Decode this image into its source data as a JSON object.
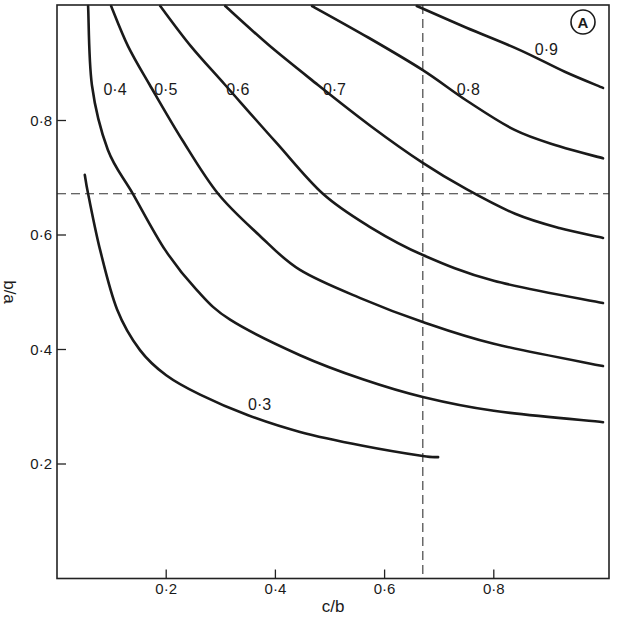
{
  "chart_data": {
    "type": "line",
    "title": "",
    "panel_label": "A",
    "xlabel": "c/b",
    "ylabel": "b/a",
    "xlim": [
      0,
      1.0
    ],
    "ylim": [
      0,
      1.0
    ],
    "grid": false,
    "legend": "none (curves labeled inline)",
    "x_ticks": [
      0.2,
      0.4,
      0.6,
      0.8
    ],
    "x_tick_labels": [
      "0·2",
      "0·4",
      "0·6",
      "0·8"
    ],
    "y_ticks": [
      0.2,
      0.4,
      0.6,
      0.8
    ],
    "y_tick_labels": [
      "0·2",
      "0·4",
      "0·6",
      "0·8"
    ],
    "reference_lines": {
      "vertical_x": 0.67,
      "horizontal_y": 0.672,
      "style": "dashed"
    },
    "series": [
      {
        "name": "0·3",
        "label_pos": [
          0.35,
          0.305
        ],
        "points": [
          [
            0.051,
            0.705
          ],
          [
            0.057,
            0.672
          ],
          [
            0.079,
            0.574
          ],
          [
            0.11,
            0.47
          ],
          [
            0.152,
            0.399
          ],
          [
            0.2,
            0.355
          ],
          [
            0.262,
            0.321
          ],
          [
            0.35,
            0.285
          ],
          [
            0.445,
            0.256
          ],
          [
            0.56,
            0.232
          ],
          [
            0.67,
            0.214
          ],
          [
            0.698,
            0.212
          ]
        ]
      },
      {
        "name": "0·4",
        "label_pos": [
          0.085,
          0.855
        ],
        "points": [
          [
            0.057,
            1.0
          ],
          [
            0.064,
            0.862
          ],
          [
            0.093,
            0.749
          ],
          [
            0.139,
            0.672
          ],
          [
            0.198,
            0.574
          ],
          [
            0.255,
            0.505
          ],
          [
            0.317,
            0.452
          ],
          [
            0.445,
            0.39
          ],
          [
            0.56,
            0.348
          ],
          [
            0.67,
            0.317
          ],
          [
            0.8,
            0.293
          ],
          [
            1.0,
            0.273
          ]
        ]
      },
      {
        "name": "0·5",
        "label_pos": [
          0.178,
          0.855
        ],
        "points": [
          [
            0.099,
            1.0
          ],
          [
            0.13,
            0.93
          ],
          [
            0.17,
            0.862
          ],
          [
            0.23,
            0.765
          ],
          [
            0.295,
            0.672
          ],
          [
            0.37,
            0.6
          ],
          [
            0.445,
            0.539
          ],
          [
            0.56,
            0.488
          ],
          [
            0.67,
            0.448
          ],
          [
            0.8,
            0.41
          ],
          [
            1.0,
            0.371
          ]
        ]
      },
      {
        "name": "0·6",
        "label_pos": [
          0.31,
          0.855
        ],
        "points": [
          [
            0.189,
            1.0
          ],
          [
            0.245,
            0.93
          ],
          [
            0.308,
            0.862
          ],
          [
            0.4,
            0.763
          ],
          [
            0.487,
            0.672
          ],
          [
            0.575,
            0.613
          ],
          [
            0.67,
            0.565
          ],
          [
            0.8,
            0.52
          ],
          [
            1.0,
            0.481
          ]
        ]
      },
      {
        "name": "0·7",
        "label_pos": [
          0.487,
          0.855
        ],
        "points": [
          [
            0.308,
            1.0
          ],
          [
            0.39,
            0.93
          ],
          [
            0.478,
            0.862
          ],
          [
            0.575,
            0.79
          ],
          [
            0.67,
            0.726
          ],
          [
            0.75,
            0.68
          ],
          [
            0.839,
            0.637
          ],
          [
            0.92,
            0.612
          ],
          [
            1.0,
            0.595
          ]
        ]
      },
      {
        "name": "0·8",
        "label_pos": [
          0.732,
          0.855
        ],
        "points": [
          [
            0.467,
            1.0
          ],
          [
            0.57,
            0.945
          ],
          [
            0.67,
            0.888
          ],
          [
            0.75,
            0.835
          ],
          [
            0.839,
            0.783
          ],
          [
            0.92,
            0.755
          ],
          [
            1.0,
            0.734
          ]
        ]
      },
      {
        "name": "0·9",
        "label_pos": [
          0.875,
          0.925
        ],
        "points": [
          [
            0.659,
            1.0
          ],
          [
            0.75,
            0.962
          ],
          [
            0.848,
            0.923
          ],
          [
            0.93,
            0.885
          ],
          [
            1.0,
            0.857
          ]
        ]
      }
    ]
  },
  "layout": {
    "plot_left_px": 57,
    "plot_right_px": 609,
    "plot_top_px": 5,
    "plot_bottom_px": 578.5,
    "x_px_per_unit": 546,
    "y_px_per_unit": 572.5
  }
}
